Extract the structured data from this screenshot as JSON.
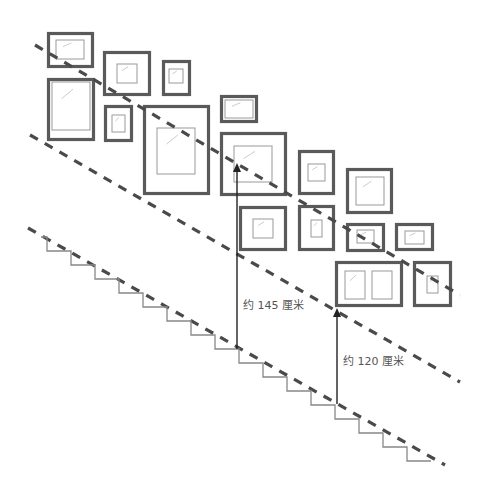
{
  "diagram": {
    "labels": {
      "upper_height": "约 145 厘米",
      "lower_height": "约 120 厘米"
    },
    "colors": {
      "frame": "#555555",
      "mat": "#888888",
      "dash": "#4a4a4a",
      "stair": "#777777",
      "arrow": "#222222",
      "text": "#555555"
    },
    "frames": [
      {
        "x": 47,
        "y": 32,
        "w": 47,
        "h": 36,
        "inner": [
          56,
          40,
          28,
          19
        ]
      },
      {
        "x": 103,
        "y": 51,
        "w": 48,
        "h": 45,
        "inner": [
          117,
          64,
          20,
          19
        ]
      },
      {
        "x": 162,
        "y": 60,
        "w": 29,
        "h": 36,
        "inner": [
          169,
          69,
          14,
          14
        ]
      },
      {
        "x": 47,
        "y": 78,
        "w": 48,
        "h": 63,
        "inner": [
          52,
          82,
          38,
          48
        ]
      },
      {
        "x": 104,
        "y": 105,
        "w": 29,
        "h": 37,
        "inner": [
          112,
          115,
          13,
          17
        ]
      },
      {
        "x": 143,
        "y": 105,
        "w": 67,
        "h": 90,
        "inner": [
          157,
          128,
          38,
          46
        ]
      },
      {
        "x": 220,
        "y": 95,
        "w": 38,
        "h": 28,
        "inner": [
          225,
          100,
          28,
          18
        ]
      },
      {
        "x": 220,
        "y": 132,
        "w": 67,
        "h": 64,
        "inner": [
          234,
          146,
          38,
          36
        ]
      },
      {
        "x": 298,
        "y": 150,
        "w": 37,
        "h": 45,
        "inner": [
          308,
          164,
          17,
          17
        ]
      },
      {
        "x": 346,
        "y": 168,
        "w": 47,
        "h": 46,
        "inner": [
          356,
          177,
          28,
          28
        ]
      },
      {
        "x": 239,
        "y": 206,
        "w": 48,
        "h": 45,
        "inner": [
          253,
          219,
          20,
          19
        ]
      },
      {
        "x": 298,
        "y": 205,
        "w": 37,
        "h": 46,
        "inner": [
          311,
          220,
          11,
          17
        ]
      },
      {
        "x": 346,
        "y": 223,
        "w": 39,
        "h": 29,
        "inner": [
          357,
          230,
          17,
          13
        ]
      },
      {
        "x": 395,
        "y": 223,
        "w": 39,
        "h": 28,
        "inner": [
          405,
          231,
          19,
          13
        ]
      },
      {
        "x": 335,
        "y": 261,
        "w": 68,
        "h": 46,
        "inner": [
          345,
          271,
          20,
          28
        ]
      },
      {
        "x": 413,
        "y": 261,
        "w": 39,
        "h": 46,
        "inner": [
          427,
          276,
          11,
          17
        ]
      }
    ],
    "extra_inner": [
      [
        372,
        271,
        20,
        28
      ]
    ]
  }
}
